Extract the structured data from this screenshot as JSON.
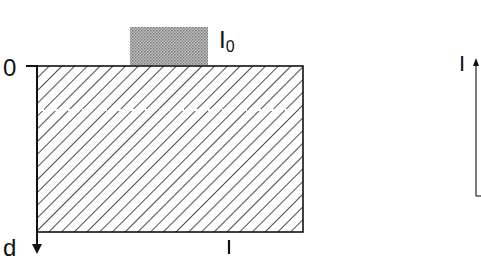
{
  "diagram": {
    "type": "absorption-layer-schematic",
    "labels": {
      "depth_origin": "0",
      "depth_axis": "d",
      "incident_intensity": "I",
      "incident_intensity_subscript": "0",
      "length": "l",
      "intensity_axis": "I"
    },
    "colors": {
      "stroke": "#111111",
      "source_block": "#a8a8a8",
      "hatch": "#222222",
      "dashed_line": "#ffffff",
      "background": "#ffffff"
    },
    "elements": [
      "incident light source block (stippled gray) labelled I0",
      "hatched absorbing medium rectangle",
      "white dashed line inside medium",
      "depth axis arrow pointing down from 0 to d",
      "length tick labelled l",
      "intensity axis arrow pointing up labelled I"
    ]
  }
}
